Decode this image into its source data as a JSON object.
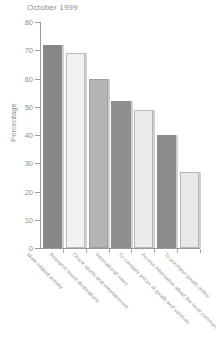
{
  "chart_data": {
    "type": "bar",
    "title": "October 1999",
    "xlabel": "",
    "ylabel": "Percentage",
    "ylim": [
      0,
      80
    ],
    "yticks": [
      0,
      10,
      20,
      30,
      40,
      50,
      60,
      70,
      80
    ],
    "grid": false,
    "legend": "none",
    "categories": [
      "Work-related activity",
      "Research travel destinations",
      "Check sports and entertainment",
      "International news",
      "To compare prices of goods and services",
      "Access information about the local community",
      "To purchase goods online"
    ],
    "values": [
      72,
      69,
      60,
      52,
      49,
      40,
      27
    ],
    "bar_colors": [
      "#878787",
      "#f2f2f2",
      "#b4b4b4",
      "#8f8f8f",
      "#ebebeb",
      "#8c8c8c",
      "#e8e8e8"
    ]
  },
  "axis": {
    "y_title": "Percentage"
  }
}
